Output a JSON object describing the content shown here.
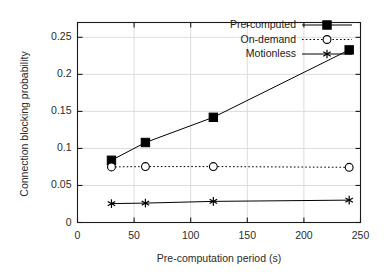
{
  "chart_data": {
    "type": "line",
    "title": "",
    "xlabel": "Pre-computation period (s)",
    "ylabel": "Connection blocking probability",
    "x": [
      30,
      60,
      120,
      240
    ],
    "xlim": [
      0,
      250
    ],
    "ylim": [
      0,
      0.27
    ],
    "xticks": [
      "0",
      "50",
      "100",
      "150",
      "200",
      "250"
    ],
    "xtick_values": [
      0,
      50,
      100,
      150,
      200,
      250
    ],
    "yticks": [
      "0",
      "0.05",
      "0.1",
      "0.15",
      "0.2",
      "0.25"
    ],
    "ytick_values": [
      0,
      0.05,
      0.1,
      0.15,
      0.2,
      0.25
    ],
    "grid": true,
    "legend_position": "top-right",
    "series": [
      {
        "name": "Pre-computed",
        "marker": "filled-square",
        "linestyle": "solid",
        "color": "#000000",
        "values": [
          0.084,
          0.108,
          0.142,
          0.233
        ]
      },
      {
        "name": "On-demand",
        "marker": "open-circle",
        "linestyle": "dotted",
        "color": "#000000",
        "values": [
          0.075,
          0.0755,
          0.0755,
          0.0745
        ]
      },
      {
        "name": "Motionless",
        "marker": "asterisk",
        "linestyle": "solid",
        "color": "#000000",
        "values": [
          0.0255,
          0.0262,
          0.0285,
          0.0302
        ]
      }
    ]
  },
  "axes": {
    "frame_color": "#1a1a1a",
    "grid_color": "#d8d8d8"
  }
}
